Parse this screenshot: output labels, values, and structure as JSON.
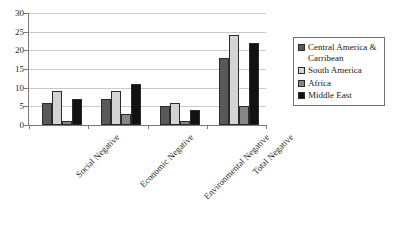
{
  "chart_data": {
    "type": "bar",
    "title": "",
    "subtitle": "",
    "xlabel": "",
    "ylabel": "",
    "ylim": [
      0,
      30
    ],
    "ytick_step": 5,
    "yticks": [
      0,
      5,
      10,
      15,
      20,
      25,
      30
    ],
    "grid": true,
    "legend_position": "right",
    "categories": [
      "Social Negative",
      "Economic Negative",
      "Environmental Negative",
      "Total Negative"
    ],
    "series": [
      {
        "name": "Central America & Carribean",
        "color": "#595959",
        "values": [
          6,
          7,
          5,
          18
        ]
      },
      {
        "name": "South America",
        "color": "#d4d4d4",
        "values": [
          9,
          9,
          6,
          24
        ]
      },
      {
        "name": "Africa",
        "color": "#868686",
        "values": [
          1,
          3,
          1,
          5
        ]
      },
      {
        "name": "Middle East",
        "color": "#111111",
        "values": [
          7,
          11,
          4,
          22
        ]
      }
    ]
  },
  "axis": {
    "y_tick_labels": [
      "30",
      "25",
      "20",
      "15",
      "10",
      "5",
      "0"
    ]
  },
  "legend": {
    "items": [
      {
        "label_line1": "Central America &",
        "label_line2": "Carribean"
      },
      {
        "label_line1": "South America",
        "label_line2": ""
      },
      {
        "label_line1": "Africa",
        "label_line2": ""
      },
      {
        "label_line1": "Middle East",
        "label_line2": ""
      }
    ]
  },
  "colors": {
    "axis": "#7a7a7a",
    "gridline": "#c9c9c9",
    "bar_border": "#2b2b2b",
    "legend_border": "#6f6f6f",
    "text": "#1a1a1a",
    "background": "#ffffff"
  }
}
